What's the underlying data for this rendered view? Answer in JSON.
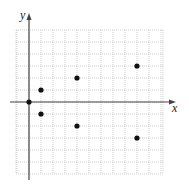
{
  "chart_data": {
    "type": "scatter",
    "title": "",
    "xlabel": "x",
    "ylabel": "y",
    "grid": true,
    "xlim": [
      -1,
      11
    ],
    "ylim": [
      -6,
      6
    ],
    "legend": null,
    "points": [
      {
        "x": 0,
        "y": 0
      },
      {
        "x": 1,
        "y": 1
      },
      {
        "x": 1,
        "y": -1
      },
      {
        "x": 4,
        "y": 2
      },
      {
        "x": 4,
        "y": -2
      },
      {
        "x": 9,
        "y": 3
      },
      {
        "x": 9,
        "y": -3
      }
    ]
  },
  "colors": {
    "axis": "#444444",
    "grid": "#bbbbbb",
    "point": "#111111"
  },
  "labels": {
    "x_axis": "x",
    "y_axis": "y"
  }
}
